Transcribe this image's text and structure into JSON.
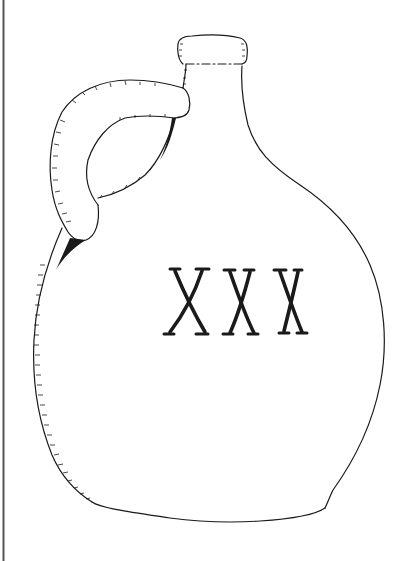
{
  "image": {
    "subject": "jug line drawing",
    "label_text": "XXX",
    "colors": {
      "background": "#ffffff",
      "ink": "#1a1a1a",
      "border": "#555555"
    }
  }
}
